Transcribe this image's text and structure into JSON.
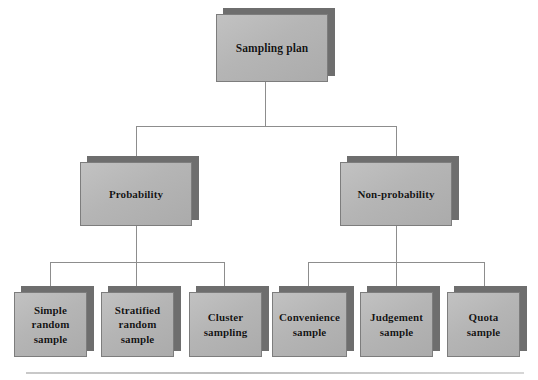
{
  "diagram": {
    "colors": {
      "box_face": "#b5b5b5",
      "box_shadow": "#6e6e6e",
      "box_border": "#7d7d7d",
      "connector": "#8d8d8d",
      "text": "#141414",
      "background": "#ffffff"
    },
    "root": {
      "label": "Sampling plan"
    },
    "branches": [
      {
        "label": "Probability"
      },
      {
        "label": "Non-probability"
      }
    ],
    "leaves": [
      {
        "label": "Simple\nrandom\nsample",
        "parent": "Probability"
      },
      {
        "label": "Stratified\nrandom\nsample",
        "parent": "Probability"
      },
      {
        "label": "Cluster\nsampling",
        "parent": "Probability"
      },
      {
        "label": "Convenience\nsample",
        "parent": "Non-probability"
      },
      {
        "label": "Judgement\nsample",
        "parent": "Non-probability"
      },
      {
        "label": "Quota\nsample",
        "parent": "Non-probability"
      }
    ]
  }
}
